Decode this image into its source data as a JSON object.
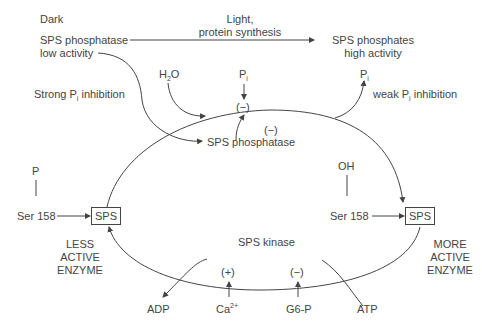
{
  "header": {
    "dark": "Dark",
    "light_line1": "Light,",
    "light_line2": "protein synthesis",
    "left_state_line1": "SPS phosphatase",
    "left_state_line2": "low activity",
    "right_state_line1": "SPS phosphates",
    "right_state_line2": "high activity"
  },
  "top": {
    "strong_inhibition": "Strong P",
    "strong_inhibition_sub": "i",
    "strong_inhibition_tail": " inhibition",
    "water": "H",
    "water_sub": "2",
    "water_tail": "O",
    "pi_center": "P",
    "pi_center_sub": "i",
    "pi_right": "P",
    "pi_right_sub": "i",
    "weak_inhibition": "weak P",
    "weak_inhibition_sub": "i",
    "weak_inhibition_tail": " inhibition",
    "minus_top": "(−)",
    "minus_bottom": "(−)",
    "phosphatase": "SPS phosphatase"
  },
  "left": {
    "group": "P",
    "residue": "Ser 158",
    "enzyme": "SPS",
    "state_line1": "LESS",
    "state_line2": "ACTIVE",
    "state_line3": "ENZYME"
  },
  "right": {
    "group": "OH",
    "residue": "Ser 158",
    "enzyme": "SPS",
    "state_line1": "MORE",
    "state_line2": "ACTIVE",
    "state_line3": "ENZYME"
  },
  "bottom": {
    "kinase": "SPS kinase",
    "adp": "ADP",
    "calcium": "Ca",
    "calcium_sup": "2+",
    "calcium_effect": "(+)",
    "g6p": "G6-P",
    "g6p_effect": "(−)",
    "atp": "ATP"
  }
}
